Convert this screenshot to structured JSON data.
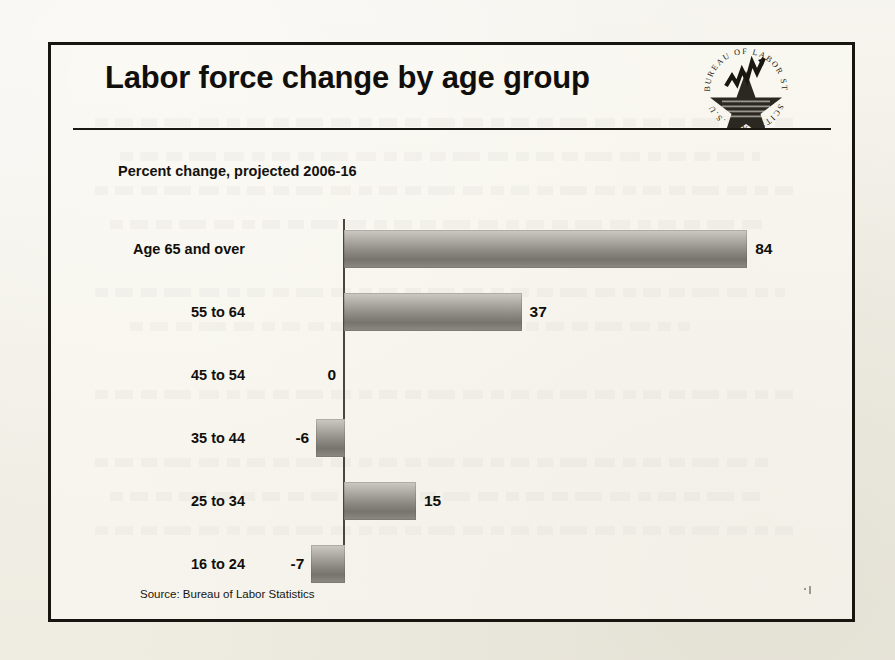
{
  "page": {
    "background_color": "#f3f1ea",
    "frame_color": "#17150f"
  },
  "header": {
    "title": "Labor force change by age group",
    "subtitle": "Percent change, projected 2006-16",
    "logo_name": "us-bureau-of-labor-statistics-seal",
    "logo_text": "U.S. BUREAU OF LABOR STATISTICS"
  },
  "footer": {
    "source": "Source: Bureau of Labor Statistics"
  },
  "chart_data": {
    "type": "bar",
    "orientation": "horizontal",
    "title": "Labor force change by age group",
    "subtitle": "Percent change, projected 2006-16",
    "xlabel": "",
    "ylabel": "",
    "grid": false,
    "legend": null,
    "source": "Source: Bureau of Labor Statistics",
    "xlim": [
      -10,
      90
    ],
    "baseline": 0,
    "categories": [
      "Age 65 and over",
      "55 to 64",
      "45 to 54",
      "35 to 44",
      "25 to 34",
      "16 to 24"
    ],
    "values": [
      84,
      37,
      0,
      -6,
      15,
      -7
    ],
    "value_labels": [
      "84",
      "37",
      "0",
      "-6",
      "15",
      "-7"
    ],
    "bars": [
      {
        "category": "Age 65 and over",
        "value": 84,
        "label": "84"
      },
      {
        "category": "55 to 64",
        "value": 37,
        "label": "37"
      },
      {
        "category": "45 to 54",
        "value": 0,
        "label": "0"
      },
      {
        "category": "35 to 44",
        "value": -6,
        "label": "-6"
      },
      {
        "category": "25 to 34",
        "value": 15,
        "label": "15"
      },
      {
        "category": "16 to 24",
        "value": -7,
        "label": "-7"
      }
    ],
    "bar_fill_light": "#cdcac4",
    "bar_fill_dark": "#77746d",
    "axis_color": "#4a463c"
  }
}
